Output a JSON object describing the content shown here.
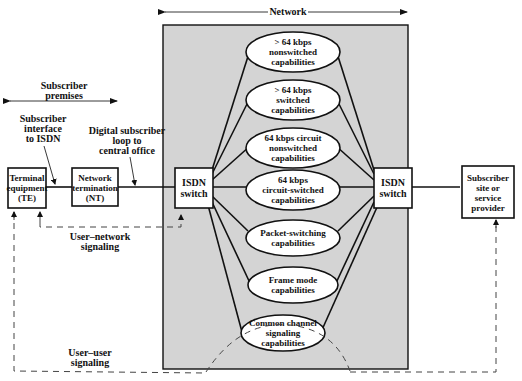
{
  "diagram": {
    "colors": {
      "network_bg": "#d4d4d4",
      "stroke": "#111111",
      "box_fill": "#ffffff"
    },
    "regions": {
      "network": {
        "label": "Network"
      },
      "subscriber_premises": {
        "label_lines": [
          "Subscriber",
          "premises"
        ]
      }
    },
    "annotations": {
      "subscriber_interface": [
        "Subscriber",
        "interface",
        "to ISDN"
      ],
      "digital_loop": [
        "Digital subscriber",
        "loop to",
        "central office"
      ],
      "user_network_signaling": [
        "User–network",
        "signaling"
      ],
      "user_user_signaling": [
        "User–user",
        "signaling"
      ]
    },
    "nodes": {
      "te": [
        "Terminal",
        "equipment",
        "(TE)"
      ],
      "nt": [
        "Network",
        "termination",
        "(NT)"
      ],
      "isdn_left": [
        "ISDN",
        "switch"
      ],
      "isdn_right": [
        "ISDN",
        "switch"
      ],
      "subscriber_site": [
        "Subscriber",
        "site or",
        "service",
        "provider"
      ]
    },
    "capabilities": [
      [
        "> 64 kbps",
        "nonswitched",
        "capabilities"
      ],
      [
        "> 64 kbps",
        "switched",
        "capabilities"
      ],
      [
        "64 kbps circuit",
        "nonswitched",
        "capabilities"
      ],
      [
        "64 kbps",
        "circuit-switched",
        "capabilities"
      ],
      [
        "Packet-switching",
        "capabilities"
      ],
      [
        "Frame mode",
        "capabilities"
      ],
      [
        "Common channel",
        "signaling",
        "capabilities"
      ]
    ]
  }
}
